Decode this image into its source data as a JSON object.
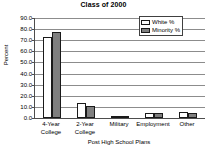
{
  "chart_data": {
    "type": "bar",
    "title": "Class of 2000",
    "xlabel": "Post High School Plans",
    "ylabel": "Percent",
    "categories": [
      "4-Year College",
      "2-Year College",
      "Military",
      "Employment",
      "Other"
    ],
    "category_lines": [
      [
        "4-Year",
        "College"
      ],
      [
        "2-Year",
        "College"
      ],
      [
        "Military",
        ""
      ],
      [
        "Employment",
        ""
      ],
      [
        "Other",
        ""
      ]
    ],
    "series": [
      {
        "name": "White %",
        "values": [
          73.0,
          13.5,
          1.5,
          4.5,
          5.5
        ],
        "color": "#ffffff"
      },
      {
        "name": "Minority %",
        "values": [
          77.0,
          11.0,
          2.0,
          4.5,
          4.5
        ],
        "color": "#7f7f7f"
      }
    ],
    "ylim": [
      0.0,
      90.0
    ],
    "ytick_step": 10.0,
    "yticks": [
      "0.0",
      "10.0",
      "20.0",
      "30.0",
      "40.0",
      "50.0",
      "60.0",
      "70.0",
      "80.0",
      "90.0"
    ],
    "grid": true,
    "legend_position": "top-right",
    "bar_outline_color": "#1a1a1a",
    "axis_color": "#4d4d4d",
    "grid_color": "#8c8c8c"
  }
}
